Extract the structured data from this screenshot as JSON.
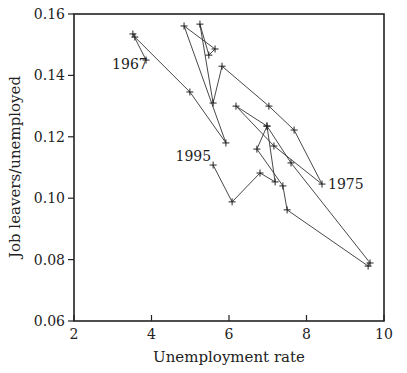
{
  "chart_data": {
    "type": "line",
    "title": "",
    "xlabel": "Unemployment rate",
    "ylabel": "Job leavers/unemployed",
    "xlim": [
      2,
      10
    ],
    "ylim": [
      0.06,
      0.16
    ],
    "xticks": [
      2,
      4,
      6,
      8,
      10
    ],
    "yticks": [
      0.06,
      0.08,
      0.1,
      0.12,
      0.14,
      0.16
    ],
    "ytick_labels": [
      "0.06",
      "0.08",
      "0.10",
      "0.12",
      "0.14",
      "0.16"
    ],
    "xtick_labels": [
      "2",
      "4",
      "6",
      "8",
      "10"
    ],
    "grid": false,
    "legend": null,
    "marker": "+",
    "series": [
      {
        "name": "1967-1995 connected scatter",
        "x": [
          3.86,
          3.52,
          3.57,
          4.99,
          5.92,
          4.84,
          5.64,
          5.48,
          5.25,
          5.59,
          5.82,
          7.03,
          7.68,
          8.4,
          7.16,
          6.18,
          6.98,
          7.6,
          9.64,
          9.59,
          7.5,
          7.39,
          6.72,
          6.98,
          7.19,
          6.8,
          6.08,
          5.59
        ],
        "y": [
          0.145,
          0.1535,
          0.1525,
          0.1346,
          0.118,
          0.1561,
          0.1486,
          0.1466,
          0.1567,
          0.131,
          0.143,
          0.13,
          0.1222,
          0.1046,
          0.117,
          0.13,
          0.1235,
          0.1115,
          0.0789,
          0.0779,
          0.0962,
          0.104,
          0.116,
          0.1235,
          0.1053,
          0.1082,
          0.0988,
          0.1108
        ]
      }
    ],
    "annotations": [
      {
        "text": "1967",
        "x": 3.86,
        "y": 0.145
      },
      {
        "text": "1975",
        "x": 8.4,
        "y": 0.1046
      },
      {
        "text": "1995",
        "x": 5.59,
        "y": 0.1108
      }
    ]
  }
}
